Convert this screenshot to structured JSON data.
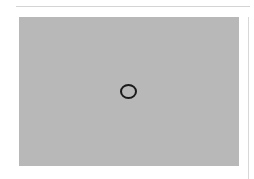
{
  "layout": {
    "top_divider": {
      "visible": true
    },
    "media": {
      "type": "image-placeholder",
      "background_color": "#b8b8b8",
      "center_icon": "circle-icon",
      "icon_color": "#1a1a1a"
    },
    "right_divider": {
      "visible": true
    }
  }
}
